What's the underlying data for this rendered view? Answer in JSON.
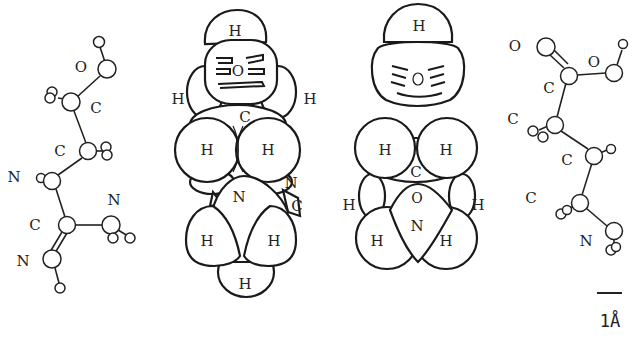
{
  "figure": {
    "panels": [
      {
        "id": "ball-and-stick-left",
        "type": "ball-and-stick",
        "labels": [
          {
            "text": "O",
            "x": 81,
            "y": 72
          },
          {
            "text": "C",
            "x": 96,
            "y": 113
          },
          {
            "text": "C",
            "x": 60,
            "y": 156
          },
          {
            "text": "N",
            "x": 14,
            "y": 182
          },
          {
            "text": "N",
            "x": 114,
            "y": 205
          },
          {
            "text": "C",
            "x": 35,
            "y": 230
          },
          {
            "text": "N",
            "x": 23,
            "y": 266
          }
        ]
      },
      {
        "id": "space-filling-left",
        "type": "space-filling",
        "labels": [
          {
            "text": "H",
            "x": 235,
            "y": 36
          },
          {
            "text": "O",
            "x": 238,
            "y": 76
          },
          {
            "text": "H",
            "x": 178,
            "y": 104
          },
          {
            "text": "H",
            "x": 310,
            "y": 104
          },
          {
            "text": "C",
            "x": 245,
            "y": 122
          },
          {
            "text": "H",
            "x": 207,
            "y": 155
          },
          {
            "text": "H",
            "x": 268,
            "y": 155
          },
          {
            "text": "N",
            "x": 239,
            "y": 202
          },
          {
            "text": "N",
            "x": 291,
            "y": 188
          },
          {
            "text": "C",
            "x": 297,
            "y": 211
          },
          {
            "text": "H",
            "x": 207,
            "y": 246
          },
          {
            "text": "H",
            "x": 274,
            "y": 246
          },
          {
            "text": "H",
            "x": 245,
            "y": 289
          }
        ]
      },
      {
        "id": "space-filling-right",
        "type": "space-filling",
        "labels": [
          {
            "text": "H",
            "x": 419,
            "y": 31
          },
          {
            "text": "O",
            "x": 418,
            "y": 84
          },
          {
            "text": "H",
            "x": 385,
            "y": 155
          },
          {
            "text": "H",
            "x": 446,
            "y": 155
          },
          {
            "text": "C",
            "x": 416,
            "y": 177
          },
          {
            "text": "H",
            "x": 349,
            "y": 210
          },
          {
            "text": "H",
            "x": 478,
            "y": 210
          },
          {
            "text": "O",
            "x": 417,
            "y": 203
          },
          {
            "text": "N",
            "x": 417,
            "y": 231
          },
          {
            "text": "H",
            "x": 377,
            "y": 246
          },
          {
            "text": "H",
            "x": 446,
            "y": 246
          }
        ]
      },
      {
        "id": "ball-and-stick-right",
        "type": "ball-and-stick",
        "labels": [
          {
            "text": "O",
            "x": 515,
            "y": 51
          },
          {
            "text": "O",
            "x": 594,
            "y": 67
          },
          {
            "text": "C",
            "x": 549,
            "y": 93
          },
          {
            "text": "C",
            "x": 513,
            "y": 124
          },
          {
            "text": "C",
            "x": 567,
            "y": 165
          },
          {
            "text": "C",
            "x": 531,
            "y": 203
          },
          {
            "text": "N",
            "x": 586,
            "y": 246
          }
        ]
      }
    ],
    "scale_bar": {
      "label": "1Å",
      "x1": 597,
      "x2": 622,
      "y": 293,
      "label_x": 610,
      "label_y": 327
    }
  }
}
